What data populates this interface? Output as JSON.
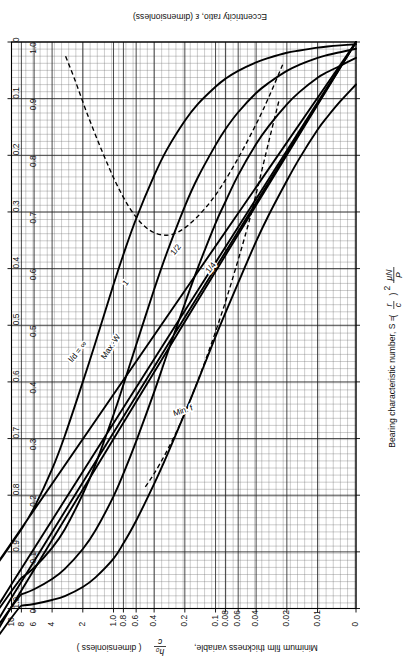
{
  "figure": {
    "name": "raimondi-boyd-minimum-film-thickness-chart",
    "orientation_note": "rotated"
  },
  "chart_data": {
    "type": "line",
    "title": "",
    "orientation": "rotated-90",
    "xlabel": "Bearing characteristic number, S = ( r/c )² μN/P",
    "xlabel_parts": {
      "lead": "Bearing characteristic number, S =",
      "paren_num": "r",
      "paren_den": "c",
      "exponent": "2",
      "frac_num": "μN",
      "frac_den": "P"
    },
    "ylabel": "Minimum film thickness variable, h₀/c (dimensionless)",
    "ylabel_parts": {
      "lead": "Minimum film thickness variable,",
      "frac_num": "h₀",
      "frac_den": "c",
      "trail": "( dimensionless )"
    },
    "y2label": "Eccentricity ratio, ε (dimensionless)",
    "xscale": "log",
    "yscale": "linear",
    "xlim": [
      0.004,
      10
    ],
    "ylim": [
      0,
      1.0
    ],
    "y2lim": [
      1.0,
      0
    ],
    "grid": true,
    "grid_style": "fine uniform mesh with heavier decade lines",
    "legend_position": "inline curve labels",
    "xticks": [
      "0",
      "0.01",
      "0.02",
      "0.04",
      "0.06",
      "0.08",
      "0.1",
      "0.2",
      "0.4",
      "0.6",
      "0.8",
      "1.0",
      "2",
      "4",
      "6",
      "8",
      "10"
    ],
    "xtick_values": [
      0.004,
      0.01,
      0.02,
      0.04,
      0.06,
      0.08,
      0.1,
      0.2,
      0.4,
      0.6,
      0.8,
      1.0,
      2,
      4,
      6,
      8,
      10
    ],
    "yticks": [
      "0",
      "0.1",
      "0.2",
      "0.3",
      "0.4",
      "0.5",
      "0.6",
      "0.7",
      "0.8",
      "0.9",
      "1.0"
    ],
    "ytick_values": [
      0,
      0.1,
      0.2,
      0.3,
      0.4,
      0.5,
      0.6,
      0.7,
      0.8,
      0.9,
      1.0
    ],
    "y2ticks": [
      "1.0",
      "0.9",
      "0.8",
      "0.7",
      "0.6",
      "0.5",
      "0.4",
      "0.3",
      "0.2",
      "0.1",
      "0"
    ],
    "y2tick_values": [
      1.0,
      0.9,
      0.8,
      0.7,
      0.6,
      0.5,
      0.4,
      0.3,
      0.2,
      0.1,
      0
    ],
    "annotations": [
      {
        "name": "max-w-label",
        "text": "Max. W",
        "x": 0.075,
        "y": 0.46
      },
      {
        "name": "min-f-label",
        "text": "Min. f",
        "x": 0.062,
        "y": 0.255
      }
    ],
    "series": [
      {
        "name": "l/d = ∞",
        "label": "l/d = ∞",
        "style": "solid",
        "points": [
          [
            0.004,
            0.075
          ],
          [
            0.006,
            0.105
          ],
          [
            0.008,
            0.132
          ],
          [
            0.01,
            0.155
          ],
          [
            0.015,
            0.205
          ],
          [
            0.02,
            0.245
          ],
          [
            0.03,
            0.305
          ],
          [
            0.04,
            0.352
          ],
          [
            0.06,
            0.425
          ],
          [
            0.08,
            0.478
          ],
          [
            0.1,
            0.52
          ],
          [
            0.15,
            0.6
          ],
          [
            0.2,
            0.655
          ],
          [
            0.3,
            0.73
          ],
          [
            0.4,
            0.78
          ],
          [
            0.6,
            0.845
          ],
          [
            0.8,
            0.885
          ],
          [
            1.0,
            0.912
          ],
          [
            1.5,
            0.945
          ],
          [
            2.0,
            0.962
          ],
          [
            3.0,
            0.978
          ],
          [
            4.0,
            0.985
          ],
          [
            6.0,
            0.992
          ],
          [
            8.0,
            0.995
          ],
          [
            10.0,
            0.997
          ]
        ]
      },
      {
        "name": "l/d = 1",
        "label": "1",
        "style": "solid",
        "points": [
          [
            0.004,
            0.028
          ],
          [
            0.006,
            0.042
          ],
          [
            0.008,
            0.053
          ],
          [
            0.01,
            0.063
          ],
          [
            0.015,
            0.088
          ],
          [
            0.02,
            0.11
          ],
          [
            0.03,
            0.148
          ],
          [
            0.04,
            0.18
          ],
          [
            0.06,
            0.235
          ],
          [
            0.08,
            0.282
          ],
          [
            0.1,
            0.32
          ],
          [
            0.15,
            0.4
          ],
          [
            0.2,
            0.462
          ],
          [
            0.3,
            0.552
          ],
          [
            0.4,
            0.618
          ],
          [
            0.6,
            0.705
          ],
          [
            0.8,
            0.762
          ],
          [
            1.0,
            0.802
          ],
          [
            1.5,
            0.862
          ],
          [
            2.0,
            0.895
          ],
          [
            3.0,
            0.93
          ],
          [
            4.0,
            0.948
          ],
          [
            6.0,
            0.966
          ],
          [
            8.0,
            0.975
          ],
          [
            10.0,
            0.981
          ]
        ]
      },
      {
        "name": "l/d = 1/2",
        "label": "1/2",
        "style": "solid",
        "points": [
          [
            0.004,
            0.012
          ],
          [
            0.006,
            0.018
          ],
          [
            0.008,
            0.023
          ],
          [
            0.01,
            0.028
          ],
          [
            0.015,
            0.04
          ],
          [
            0.02,
            0.051
          ],
          [
            0.03,
            0.072
          ],
          [
            0.04,
            0.09
          ],
          [
            0.06,
            0.124
          ],
          [
            0.08,
            0.154
          ],
          [
            0.1,
            0.182
          ],
          [
            0.15,
            0.24
          ],
          [
            0.2,
            0.29
          ],
          [
            0.3,
            0.372
          ],
          [
            0.4,
            0.437
          ],
          [
            0.6,
            0.535
          ],
          [
            0.8,
            0.605
          ],
          [
            1.0,
            0.658
          ],
          [
            1.5,
            0.745
          ],
          [
            2.0,
            0.798
          ],
          [
            3.0,
            0.86
          ],
          [
            4.0,
            0.893
          ],
          [
            6.0,
            0.928
          ],
          [
            8.0,
            0.946
          ],
          [
            10.0,
            0.957
          ]
        ]
      },
      {
        "name": "l/d = 1/4",
        "label": "1/4",
        "style": "solid",
        "points": [
          [
            0.004,
            0.004
          ],
          [
            0.006,
            0.006
          ],
          [
            0.008,
            0.008
          ],
          [
            0.01,
            0.01
          ],
          [
            0.015,
            0.015
          ],
          [
            0.02,
            0.019
          ],
          [
            0.03,
            0.028
          ],
          [
            0.04,
            0.036
          ],
          [
            0.06,
            0.051
          ],
          [
            0.08,
            0.065
          ],
          [
            0.1,
            0.079
          ],
          [
            0.15,
            0.11
          ],
          [
            0.2,
            0.139
          ],
          [
            0.3,
            0.19
          ],
          [
            0.4,
            0.236
          ],
          [
            0.6,
            0.312
          ],
          [
            0.8,
            0.375
          ],
          [
            1.0,
            0.428
          ],
          [
            1.5,
            0.53
          ],
          [
            2.0,
            0.6
          ],
          [
            3.0,
            0.695
          ],
          [
            4.0,
            0.754
          ],
          [
            6.0,
            0.822
          ],
          [
            8.0,
            0.86
          ],
          [
            10.0,
            0.884
          ]
        ]
      },
      {
        "name": "Max. W locus",
        "label": "Max. W",
        "style": "dashed",
        "points": [
          [
            0.024,
            0.105
          ],
          [
            0.03,
            0.175
          ],
          [
            0.04,
            0.268
          ],
          [
            0.05,
            0.335
          ],
          [
            0.07,
            0.425
          ],
          [
            0.09,
            0.487
          ],
          [
            0.12,
            0.552
          ],
          [
            0.16,
            0.612
          ],
          [
            0.22,
            0.672
          ],
          [
            0.3,
            0.722
          ],
          [
            0.4,
            0.762
          ],
          [
            0.5,
            0.788
          ]
        ]
      },
      {
        "name": "Min. f locus",
        "label": "Min. f",
        "style": "dashed",
        "points": [
          [
            0.022,
            0.04
          ],
          [
            0.03,
            0.097
          ],
          [
            0.04,
            0.145
          ],
          [
            0.06,
            0.205
          ],
          [
            0.09,
            0.258
          ],
          [
            0.13,
            0.296
          ],
          [
            0.19,
            0.325
          ],
          [
            0.27,
            0.34
          ],
          [
            0.38,
            0.338
          ],
          [
            0.52,
            0.322
          ],
          [
            0.7,
            0.292
          ],
          [
            0.95,
            0.248
          ],
          [
            1.3,
            0.192
          ],
          [
            1.8,
            0.128
          ],
          [
            2.4,
            0.066
          ],
          [
            3.0,
            0.022
          ]
        ]
      }
    ]
  }
}
